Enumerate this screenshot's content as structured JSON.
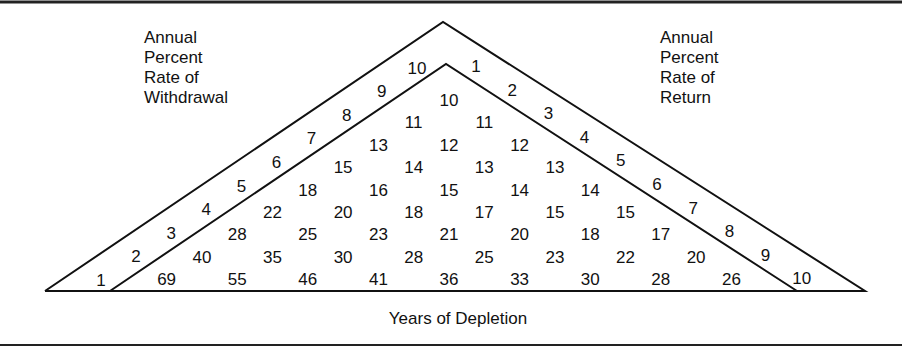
{
  "chart_data": {
    "type": "table",
    "title": "",
    "left_label": [
      "Annual",
      "Percent",
      "Rate of",
      "Withdrawal"
    ],
    "right_label": [
      "Annual",
      "Percent",
      "Rate of",
      "Return"
    ],
    "xlabel": "Years of Depletion",
    "withdrawal_rates": [
      1,
      2,
      3,
      4,
      5,
      6,
      7,
      8,
      9,
      10
    ],
    "return_rates": [
      1,
      2,
      3,
      4,
      5,
      6,
      7,
      8,
      9,
      10
    ],
    "rows": [
      [
        10
      ],
      [
        11,
        11
      ],
      [
        13,
        12,
        12
      ],
      [
        15,
        14,
        13,
        13
      ],
      [
        18,
        16,
        15,
        14,
        14
      ],
      [
        22,
        20,
        18,
        17,
        15,
        15
      ],
      [
        28,
        25,
        23,
        21,
        20,
        18,
        17
      ],
      [
        40,
        35,
        30,
        28,
        25,
        23,
        22,
        20
      ],
      [
        69,
        55,
        46,
        41,
        36,
        33,
        30,
        28,
        26
      ]
    ]
  }
}
